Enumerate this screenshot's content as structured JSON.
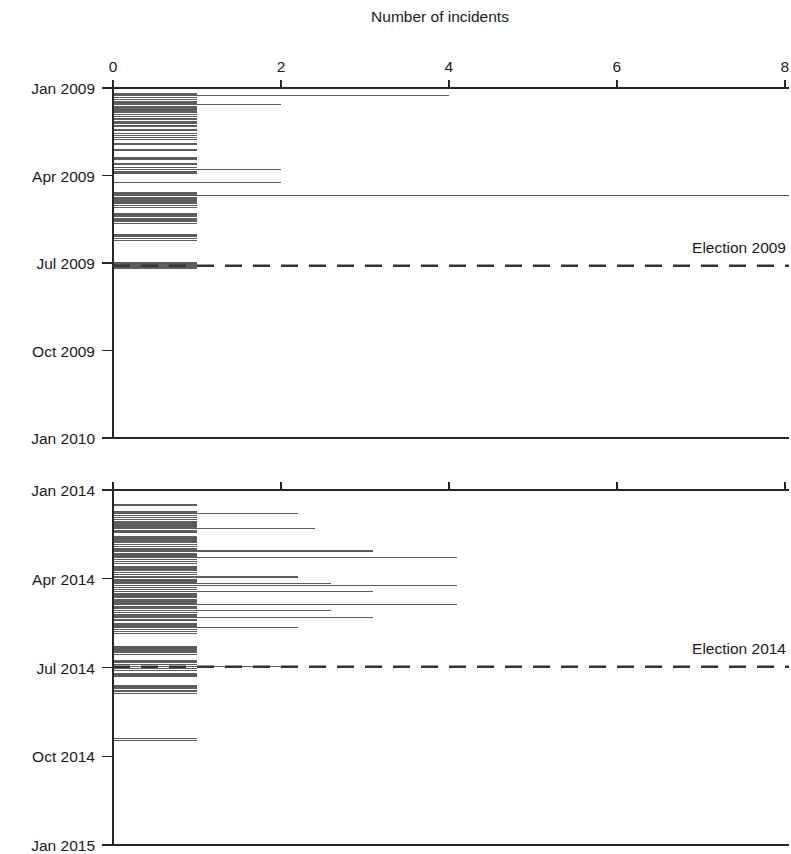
{
  "figure": {
    "title": "Number of incidents",
    "background_color": "#ffffff",
    "line_color": "#5d5d5d",
    "axis_color": "#262626",
    "event_line_color": "#333333",
    "width": 791,
    "height": 854
  },
  "chart_data": {
    "type": "bar",
    "orientation": "horizontal",
    "title": "Number of incidents",
    "xlabel": "Number of incidents",
    "ylabel": "",
    "xlim": [
      0,
      8.05
    ],
    "grid": false,
    "legend": null,
    "panels": [
      {
        "name": "panel-2009",
        "ylim_labels": [
          "Jan 2009",
          "Apr 2009",
          "Jul 2009",
          "Oct 2009",
          "Jan 2010"
        ],
        "ytick_labels": [
          "Jan 2009",
          "Apr 2009",
          "Jul 2009",
          "Oct 2009",
          "Jan 2010"
        ],
        "xtick_labels": [
          "0",
          "2",
          "4",
          "6",
          "8"
        ],
        "xtick_values": [
          0,
          2,
          4,
          6,
          8
        ],
        "annotation": {
          "label": "Election 2009",
          "at_y_fraction": 0.508,
          "style": "dashed"
        },
        "series_name": "Daily incidents 2009",
        "note": "Each row is one day; value = number of incidents that day.",
        "bars": [
          {
            "t": 0.015,
            "v": 1.0
          },
          {
            "t": 0.022,
            "v": 4.0
          },
          {
            "t": 0.028,
            "v": 1.0
          },
          {
            "t": 0.034,
            "v": 1.0
          },
          {
            "t": 0.04,
            "v": 1.0
          },
          {
            "t": 0.046,
            "v": 2.0
          },
          {
            "t": 0.052,
            "v": 1.0
          },
          {
            "t": 0.058,
            "v": 1.0
          },
          {
            "t": 0.064,
            "v": 1.0
          },
          {
            "t": 0.07,
            "v": 1.0
          },
          {
            "t": 0.076,
            "v": 1.0
          },
          {
            "t": 0.082,
            "v": 1.0
          },
          {
            "t": 0.09,
            "v": 1.0
          },
          {
            "t": 0.098,
            "v": 1.0
          },
          {
            "t": 0.106,
            "v": 1.0
          },
          {
            "t": 0.118,
            "v": 1.0
          },
          {
            "t": 0.13,
            "v": 1.0
          },
          {
            "t": 0.142,
            "v": 1.0
          },
          {
            "t": 0.158,
            "v": 1.0
          },
          {
            "t": 0.175,
            "v": 1.0
          },
          {
            "t": 0.2,
            "v": 1.0
          },
          {
            "t": 0.215,
            "v": 1.0
          },
          {
            "t": 0.228,
            "v": 1.0
          },
          {
            "t": 0.233,
            "v": 2.0
          },
          {
            "t": 0.24,
            "v": 1.0
          },
          {
            "t": 0.27,
            "v": 2.0
          },
          {
            "t": 0.3,
            "v": 1.0
          },
          {
            "t": 0.306,
            "v": 8.05
          },
          {
            "t": 0.312,
            "v": 1.0
          },
          {
            "t": 0.318,
            "v": 1.0
          },
          {
            "t": 0.324,
            "v": 1.0
          },
          {
            "t": 0.33,
            "v": 1.0
          },
          {
            "t": 0.336,
            "v": 1.0
          },
          {
            "t": 0.36,
            "v": 1.0
          },
          {
            "t": 0.368,
            "v": 1.0
          },
          {
            "t": 0.375,
            "v": 1.0
          },
          {
            "t": 0.382,
            "v": 1.0
          },
          {
            "t": 0.42,
            "v": 1.0
          },
          {
            "t": 0.43,
            "v": 1.0
          },
          {
            "t": 0.5,
            "v": 1.0
          },
          {
            "t": 0.506,
            "v": 1.0
          },
          {
            "t": 0.512,
            "v": 1.0
          }
        ]
      },
      {
        "name": "panel-2014",
        "ylim_labels": [
          "Jan 2014",
          "Apr 2014",
          "Jul 2014",
          "Oct 2014",
          "Jan 2015"
        ],
        "ytick_labels": [
          "Jan 2014",
          "Apr 2014",
          "Jul 2014",
          "Oct 2014",
          "Jan 2015"
        ],
        "xtick_labels": [
          "0",
          "2",
          "4",
          "6",
          "8"
        ],
        "xtick_values": [
          0,
          2,
          4,
          6,
          8
        ],
        "annotation": {
          "label": "Election 2014",
          "at_y_fraction": 0.498,
          "style": "dashed"
        },
        "series_name": "Daily incidents 2014",
        "note": "Each row is one day; value = number of incidents that day.",
        "bars": [
          {
            "t": 0.04,
            "v": 1.0
          },
          {
            "t": 0.06,
            "v": 1.0
          },
          {
            "t": 0.066,
            "v": 2.2
          },
          {
            "t": 0.072,
            "v": 1.0
          },
          {
            "t": 0.078,
            "v": 1.0
          },
          {
            "t": 0.084,
            "v": 1.0
          },
          {
            "t": 0.09,
            "v": 1.0
          },
          {
            "t": 0.096,
            "v": 1.0
          },
          {
            "t": 0.102,
            "v": 1.0
          },
          {
            "t": 0.108,
            "v": 2.4
          },
          {
            "t": 0.114,
            "v": 1.0
          },
          {
            "t": 0.13,
            "v": 1.0
          },
          {
            "t": 0.136,
            "v": 1.0
          },
          {
            "t": 0.142,
            "v": 1.0
          },
          {
            "t": 0.148,
            "v": 1.0
          },
          {
            "t": 0.154,
            "v": 1.0
          },
          {
            "t": 0.16,
            "v": 1.0
          },
          {
            "t": 0.166,
            "v": 1.0
          },
          {
            "t": 0.172,
            "v": 3.1
          },
          {
            "t": 0.178,
            "v": 1.0
          },
          {
            "t": 0.184,
            "v": 1.0
          },
          {
            "t": 0.19,
            "v": 4.1
          },
          {
            "t": 0.196,
            "v": 1.0
          },
          {
            "t": 0.202,
            "v": 1.0
          },
          {
            "t": 0.215,
            "v": 1.0
          },
          {
            "t": 0.221,
            "v": 1.0
          },
          {
            "t": 0.227,
            "v": 1.0
          },
          {
            "t": 0.233,
            "v": 1.0
          },
          {
            "t": 0.239,
            "v": 1.0
          },
          {
            "t": 0.245,
            "v": 2.2
          },
          {
            "t": 0.251,
            "v": 1.0
          },
          {
            "t": 0.257,
            "v": 1.0
          },
          {
            "t": 0.263,
            "v": 2.6
          },
          {
            "t": 0.269,
            "v": 4.1
          },
          {
            "t": 0.275,
            "v": 1.0
          },
          {
            "t": 0.281,
            "v": 1.0
          },
          {
            "t": 0.287,
            "v": 3.1
          },
          {
            "t": 0.293,
            "v": 1.0
          },
          {
            "t": 0.299,
            "v": 1.0
          },
          {
            "t": 0.31,
            "v": 1.0
          },
          {
            "t": 0.316,
            "v": 1.0
          },
          {
            "t": 0.322,
            "v": 4.1
          },
          {
            "t": 0.328,
            "v": 1.0
          },
          {
            "t": 0.334,
            "v": 1.0
          },
          {
            "t": 0.34,
            "v": 2.6
          },
          {
            "t": 0.346,
            "v": 1.0
          },
          {
            "t": 0.352,
            "v": 1.0
          },
          {
            "t": 0.358,
            "v": 3.1
          },
          {
            "t": 0.364,
            "v": 1.0
          },
          {
            "t": 0.375,
            "v": 1.0
          },
          {
            "t": 0.381,
            "v": 1.0
          },
          {
            "t": 0.387,
            "v": 2.2
          },
          {
            "t": 0.393,
            "v": 1.0
          },
          {
            "t": 0.399,
            "v": 1.0
          },
          {
            "t": 0.44,
            "v": 1.0
          },
          {
            "t": 0.446,
            "v": 1.0
          },
          {
            "t": 0.452,
            "v": 1.0
          },
          {
            "t": 0.458,
            "v": 1.0
          },
          {
            "t": 0.48,
            "v": 1.0
          },
          {
            "t": 0.486,
            "v": 1.0
          },
          {
            "t": 0.492,
            "v": 1.0
          },
          {
            "t": 0.498,
            "v": 2.2
          },
          {
            "t": 0.504,
            "v": 1.0
          },
          {
            "t": 0.516,
            "v": 1.0
          },
          {
            "t": 0.522,
            "v": 1.0
          },
          {
            "t": 0.552,
            "v": 1.0
          },
          {
            "t": 0.56,
            "v": 1.0
          },
          {
            "t": 0.568,
            "v": 1.0
          },
          {
            "t": 0.7,
            "v": 1.0
          }
        ]
      }
    ]
  }
}
